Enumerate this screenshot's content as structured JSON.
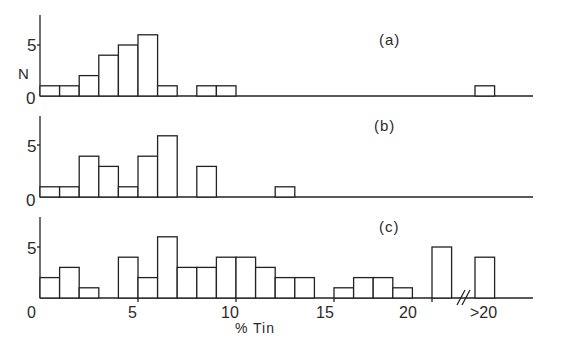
{
  "chart_data": [
    {
      "type": "bar",
      "panel_label": "(a)",
      "ylabel": "N",
      "y_ticks": [
        "0",
        "5"
      ],
      "bins": [
        "0-1",
        "1-2",
        "2-3",
        "3-4",
        "4-5",
        "5-6",
        "6-7",
        "7-8",
        "8-9",
        "9-10",
        "10-11",
        "11-12",
        "12-13",
        "13-14",
        "14-15",
        "15-16",
        "16-17",
        "17-18",
        "18-19",
        "19-20",
        "20-21",
        ">20"
      ],
      "values": [
        1,
        1,
        2,
        4,
        5,
        6,
        1,
        0,
        1,
        1,
        0,
        0,
        0,
        0,
        0,
        0,
        0,
        0,
        0,
        0,
        0,
        1
      ]
    },
    {
      "type": "bar",
      "panel_label": "(b)",
      "y_ticks": [
        "0",
        "5"
      ],
      "bins": [
        "0-1",
        "1-2",
        "2-3",
        "3-4",
        "4-5",
        "5-6",
        "6-7",
        "7-8",
        "8-9",
        "9-10",
        "10-11",
        "11-12",
        "12-13",
        "13-14",
        "14-15",
        "15-16",
        "16-17",
        "17-18",
        "18-19",
        "19-20",
        "20-21",
        ">20"
      ],
      "values": [
        1,
        1,
        4,
        3,
        1,
        4,
        6,
        0,
        3,
        0,
        0,
        0,
        1,
        0,
        0,
        0,
        0,
        0,
        0,
        0,
        0,
        0
      ]
    },
    {
      "type": "bar",
      "panel_label": "(c)",
      "y_ticks": [
        "0",
        "5"
      ],
      "bins": [
        "0-1",
        "1-2",
        "2-3",
        "3-4",
        "4-5",
        "5-6",
        "6-7",
        "7-8",
        "8-9",
        "9-10",
        "10-11",
        "11-12",
        "12-13",
        "13-14",
        "14-15",
        "15-16",
        "16-17",
        "17-18",
        "18-19",
        "19-20",
        "20-21",
        ">20"
      ],
      "values": [
        2,
        3,
        1,
        0,
        4,
        2,
        6,
        3,
        3,
        4,
        4,
        3,
        2,
        2,
        0,
        1,
        2,
        2,
        1,
        0,
        5,
        4
      ]
    }
  ],
  "labels": {
    "ylabel": "N",
    "xlabel": "% Tin",
    "x_ticks": [
      "0",
      "5",
      "10",
      "15",
      "20",
      ">20"
    ],
    "panel_a": "(a)",
    "panel_b": "(b)",
    "panel_c": "(c)",
    "y_tick_0": "0",
    "y_tick_5": "5",
    "axis_break": "//"
  }
}
